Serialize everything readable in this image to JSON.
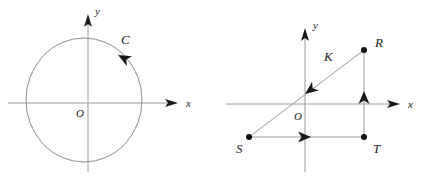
{
  "figure": {
    "width": 423,
    "height": 185,
    "background": "#ffffff",
    "stroke_color": "#9a9a9a",
    "label_color": "#1a1a1a",
    "panels": [
      {
        "id": "left-panel",
        "name": "oriented-circle-diagram",
        "origin": {
          "x": 88,
          "y": 103
        },
        "axes": {
          "x_label": "x",
          "y_label": "y",
          "origin_label": "O",
          "x_start": {
            "x": 8,
            "y": 103
          },
          "x_end": {
            "x": 178,
            "y": 103
          },
          "y_start": {
            "x": 88,
            "y": 172
          },
          "y_end": {
            "x": 88,
            "y": 14
          },
          "x_label_pos": {
            "x": 186,
            "y": 107
          },
          "y_label_pos": {
            "x": 95,
            "y": 15
          },
          "origin_label_pos": {
            "x": 76,
            "y": 117
          }
        },
        "circle": {
          "label": "C",
          "center": {
            "x": 84,
            "y": 100
          },
          "radius_x": 58,
          "radius_y": 62,
          "label_pos": {
            "x": 121,
            "y": 44
          },
          "orientation": "clockwise",
          "direction_arrow": {
            "x": 118,
            "y": 55,
            "angle_deg": 208
          }
        }
      },
      {
        "id": "right-panel",
        "name": "closed-path-triangle-diagram",
        "origin": {
          "x": 305,
          "y": 104
        },
        "axes": {
          "x_label": "x",
          "y_label": "y",
          "origin_label": "O",
          "x_start": {
            "x": 226,
            "y": 104
          },
          "x_end": {
            "x": 400,
            "y": 104
          },
          "y_start": {
            "x": 305,
            "y": 172
          },
          "y_end": {
            "x": 305,
            "y": 28
          },
          "x_label_pos": {
            "x": 408,
            "y": 108
          },
          "y_label_pos": {
            "x": 313,
            "y": 29
          },
          "origin_label_pos": {
            "x": 294,
            "y": 120
          }
        },
        "points": [
          {
            "label": "R",
            "x": 364,
            "y": 50,
            "label_pos": {
              "x": 375,
              "y": 47
            }
          },
          {
            "label": "S",
            "x": 249,
            "y": 137,
            "label_pos": {
              "x": 236,
              "y": 153
            }
          },
          {
            "label": "T",
            "x": 364,
            "y": 137,
            "label_pos": {
              "x": 373,
              "y": 153
            }
          }
        ],
        "path": {
          "label": "K",
          "label_pos": {
            "x": 324,
            "y": 61
          },
          "segments": [
            {
              "name": "segment-ST",
              "from": {
                "x": 249,
                "y": 137
              },
              "to": {
                "x": 364,
                "y": 137
              },
              "arrow": {
                "x": 311,
                "y": 137,
                "angle_deg": 0
              }
            },
            {
              "name": "segment-TR",
              "from": {
                "x": 364,
                "y": 137
              },
              "to": {
                "x": 364,
                "y": 50
              },
              "arrow": {
                "x": 364,
                "y": 91,
                "angle_deg": 270
              }
            },
            {
              "name": "segment-RS",
              "from": {
                "x": 364,
                "y": 50
              },
              "to": {
                "x": 249,
                "y": 137
              },
              "arrow": {
                "x": 305,
                "y": 94,
                "angle_deg": 143
              }
            }
          ]
        }
      }
    ]
  }
}
